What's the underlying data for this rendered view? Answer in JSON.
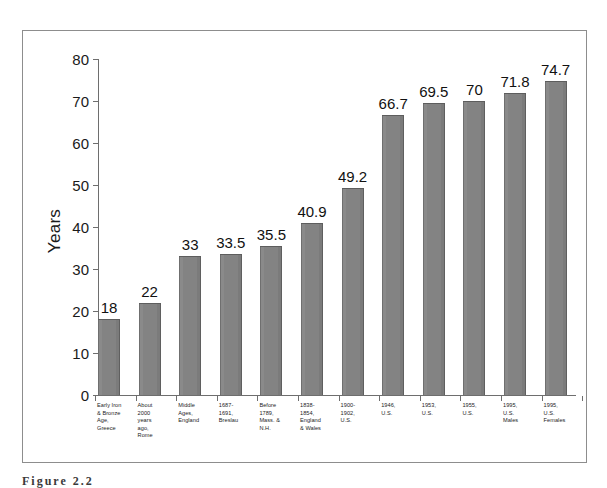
{
  "chart_data": {
    "type": "bar",
    "title": "",
    "xlabel": "",
    "ylabel": "Years",
    "ylim": [
      0,
      80
    ],
    "yticks": [
      0,
      10,
      20,
      30,
      40,
      50,
      60,
      70,
      80
    ],
    "ytick_labels": [
      "0",
      "10",
      "20",
      "30",
      "40",
      "50",
      "60",
      "70",
      "80"
    ],
    "grid": false,
    "legend": "none",
    "bar_color": "#838383",
    "categories": [
      "Early Iron & Bronze Age, Greece",
      "About 2000 years ago, Rome",
      "Middle Ages, England",
      "1687-1691, Breslau",
      "Before 1789, Mass. & N.H.",
      "1838-1854, England & Wales",
      "1900-1902, U.S.",
      "1946, U.S.",
      "1953, U.S.",
      "1955, U.S.",
      "1995, U.S. Males",
      "1995, U.S. Females"
    ],
    "category_lines": [
      [
        "Early Iron",
        "& Bronze",
        "Age,",
        "Greece"
      ],
      [
        "About",
        "2000",
        "years",
        "ago,",
        "Rome"
      ],
      [
        "Middle",
        "Ages,",
        "England"
      ],
      [
        "1687-",
        "1691,",
        "Breslau"
      ],
      [
        "Before",
        "1789,",
        "Mass. &",
        "N.H."
      ],
      [
        "1838-",
        "1854,",
        "England",
        "& Wales"
      ],
      [
        "1900-",
        "1902,",
        "U.S."
      ],
      [
        "1946,",
        "U.S."
      ],
      [
        "1953,",
        "U.S."
      ],
      [
        "1955,",
        "U.S."
      ],
      [
        "1995,",
        "U.S.",
        "Males"
      ],
      [
        "1995,",
        "U.S.",
        "Females"
      ]
    ],
    "values": [
      18,
      22,
      33,
      33.5,
      35.5,
      40.9,
      49.2,
      66.7,
      69.5,
      70,
      71.8,
      74.7
    ],
    "value_labels": [
      "18",
      "22",
      "33",
      "33.5",
      "35.5",
      "40.9",
      "49.2",
      "66.7",
      "69.5",
      "70",
      "71.8",
      "74.7"
    ]
  },
  "caption": {
    "text": "Figure  2.2"
  }
}
